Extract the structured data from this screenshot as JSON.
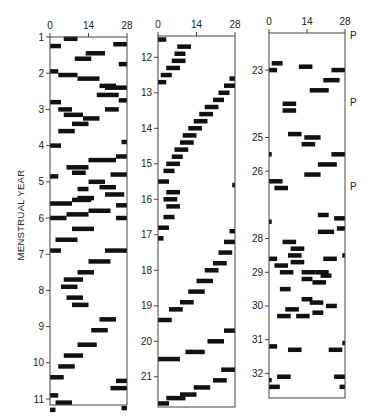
{
  "chart_data": {
    "type": "heatmap",
    "title": "",
    "ylabel": "MENSTRUAL YEAR",
    "xlabel": "",
    "x_range": [
      0,
      28
    ],
    "x_ticks": [
      0,
      14,
      28
    ],
    "annotation_label": "P",
    "panels": [
      {
        "name": "panel-1",
        "ylim": [
          1,
          11.2
        ],
        "y_ticks": [
          1,
          2,
          3,
          4,
          5,
          6,
          7,
          8,
          9,
          10,
          11
        ],
        "marks": [
          [
            5,
            10,
            1.05
          ],
          [
            0,
            4,
            1.25
          ],
          [
            23,
            28,
            1.2
          ],
          [
            13,
            20,
            1.45
          ],
          [
            9,
            15,
            1.6
          ],
          [
            25,
            28,
            1.75
          ],
          [
            0,
            3,
            1.95
          ],
          [
            3,
            10,
            2.05
          ],
          [
            10,
            18,
            2.15
          ],
          [
            18,
            24,
            2.35
          ],
          [
            20,
            28,
            2.4
          ],
          [
            17,
            25,
            2.6
          ],
          [
            25,
            28,
            2.75
          ],
          [
            0,
            4,
            2.8
          ],
          [
            3,
            8,
            3.0
          ],
          [
            20,
            25,
            3.0
          ],
          [
            5,
            12,
            3.15
          ],
          [
            12,
            18,
            3.25
          ],
          [
            8,
            14,
            3.4
          ],
          [
            3,
            9,
            3.6
          ],
          [
            0,
            4,
            4.0
          ],
          [
            26,
            28,
            3.9
          ],
          [
            14,
            24,
            4.4
          ],
          [
            24,
            28,
            4.3
          ],
          [
            6,
            14,
            4.6
          ],
          [
            8,
            13,
            4.75
          ],
          [
            0,
            3,
            4.85
          ],
          [
            22,
            28,
            4.8
          ],
          [
            14,
            20,
            5.0
          ],
          [
            18,
            24,
            5.15
          ],
          [
            10,
            14,
            5.2
          ],
          [
            20,
            27,
            5.35
          ],
          [
            10,
            16,
            5.45
          ],
          [
            0,
            8,
            5.6
          ],
          [
            8,
            15,
            5.5
          ],
          [
            24,
            28,
            5.65
          ],
          [
            0,
            6,
            6.0
          ],
          [
            6,
            14,
            5.9
          ],
          [
            14,
            22,
            5.8
          ],
          [
            24,
            28,
            6.0
          ],
          [
            8,
            16,
            6.3
          ],
          [
            2,
            10,
            6.6
          ],
          [
            0,
            4,
            6.9
          ],
          [
            20,
            28,
            6.9
          ],
          [
            14,
            22,
            7.2
          ],
          [
            10,
            16,
            7.5
          ],
          [
            5,
            12,
            7.7
          ],
          [
            4,
            10,
            7.9
          ],
          [
            6,
            12,
            8.2
          ],
          [
            8,
            14,
            8.4
          ],
          [
            18,
            24,
            8.8
          ],
          [
            15,
            21,
            9.1
          ],
          [
            10,
            17,
            9.5
          ],
          [
            5,
            12,
            9.8
          ],
          [
            3,
            9,
            10.1
          ],
          [
            0,
            5,
            10.4
          ],
          [
            24,
            28,
            10.5
          ],
          [
            22,
            28,
            10.7
          ],
          [
            0,
            3,
            10.9
          ],
          [
            2,
            8,
            11.1
          ],
          [
            26,
            28,
            11.25
          ],
          [
            0,
            2,
            11.3
          ]
        ]
      },
      {
        "name": "panel-2",
        "ylim": [
          11.4,
          21.8
        ],
        "y_ticks": [
          12,
          13,
          14,
          15,
          16,
          17,
          18,
          19,
          20,
          21
        ],
        "marks": [
          [
            0,
            3,
            11.5
          ],
          [
            7,
            12,
            11.7
          ],
          [
            6,
            10,
            11.9
          ],
          [
            5,
            10,
            12.1
          ],
          [
            3,
            8,
            12.3
          ],
          [
            1,
            5,
            12.5
          ],
          [
            0,
            3,
            12.7
          ],
          [
            26,
            28,
            12.6
          ],
          [
            24,
            28,
            12.8
          ],
          [
            22,
            26,
            13.0
          ],
          [
            20,
            24,
            13.2
          ],
          [
            17,
            22,
            13.4
          ],
          [
            15,
            20,
            13.6
          ],
          [
            13,
            18,
            13.8
          ],
          [
            11,
            16,
            14.0
          ],
          [
            9,
            14,
            14.2
          ],
          [
            8,
            13,
            14.4
          ],
          [
            6,
            11,
            14.6
          ],
          [
            5,
            9,
            14.8
          ],
          [
            3,
            8,
            15.0
          ],
          [
            2,
            6,
            15.2
          ],
          [
            0,
            4,
            15.5
          ],
          [
            27,
            28,
            15.6
          ],
          [
            3,
            8,
            15.8
          ],
          [
            2,
            7,
            16.0
          ],
          [
            3,
            8,
            16.2
          ],
          [
            2,
            6,
            16.5
          ],
          [
            0,
            4,
            16.8
          ],
          [
            0,
            2,
            17.1
          ],
          [
            26,
            28,
            16.9
          ],
          [
            24,
            28,
            17.2
          ],
          [
            22,
            27,
            17.5
          ],
          [
            20,
            25,
            17.8
          ],
          [
            17,
            22,
            18.0
          ],
          [
            14,
            20,
            18.3
          ],
          [
            11,
            17,
            18.6
          ],
          [
            8,
            13,
            18.9
          ],
          [
            4,
            9,
            19.1
          ],
          [
            0,
            5,
            19.4
          ],
          [
            24,
            28,
            19.7
          ],
          [
            18,
            24,
            20.0
          ],
          [
            10,
            17,
            20.3
          ],
          [
            0,
            8,
            20.5
          ],
          [
            23,
            28,
            20.8
          ],
          [
            20,
            25,
            21.1
          ],
          [
            13,
            19,
            21.3
          ],
          [
            8,
            14,
            21.5
          ],
          [
            3,
            10,
            21.6
          ],
          [
            0,
            4,
            21.75
          ]
        ]
      },
      {
        "name": "panel-3",
        "ylim": [
          21.9,
          32.7
        ],
        "y_ticks": [
          23,
          25,
          26,
          28,
          29,
          30,
          31,
          32
        ],
        "p_marks": [
          21.95,
          23.95,
          26.45
        ],
        "marks": [
          [
            1,
            5,
            22.8
          ],
          [
            0,
            3,
            23.0
          ],
          [
            11,
            16,
            22.9
          ],
          [
            23,
            28,
            23.0
          ],
          [
            20,
            26,
            23.3
          ],
          [
            15,
            22,
            23.6
          ],
          [
            5,
            10,
            24.0
          ],
          [
            5,
            10,
            24.2
          ],
          [
            7,
            12,
            24.9
          ],
          [
            13,
            19,
            25.0
          ],
          [
            12,
            17,
            25.2
          ],
          [
            23,
            28,
            25.5
          ],
          [
            18,
            25,
            25.8
          ],
          [
            13,
            19,
            26.1
          ],
          [
            0,
            1,
            25.5
          ],
          [
            0,
            5,
            26.3
          ],
          [
            2,
            7,
            26.5
          ],
          [
            18,
            22,
            27.3
          ],
          [
            24,
            28,
            27.4
          ],
          [
            0,
            1,
            27.5
          ],
          [
            18,
            24,
            27.8
          ],
          [
            25,
            28,
            27.7
          ],
          [
            5,
            10,
            28.1
          ],
          [
            8,
            13,
            28.3
          ],
          [
            7,
            12,
            28.5
          ],
          [
            8,
            13,
            28.7
          ],
          [
            0,
            3,
            28.6
          ],
          [
            2,
            7,
            28.8
          ],
          [
            20,
            25,
            28.6
          ],
          [
            27,
            28,
            28.5
          ],
          [
            4,
            9,
            29.0
          ],
          [
            12,
            17,
            29.0
          ],
          [
            17,
            22,
            29.0
          ],
          [
            19,
            23,
            29.1
          ],
          [
            12,
            16,
            29.2
          ],
          [
            16,
            21,
            29.3
          ],
          [
            4,
            8,
            29.5
          ],
          [
            12,
            16,
            29.8
          ],
          [
            15,
            20,
            29.9
          ],
          [
            21,
            25,
            30.0
          ],
          [
            6,
            11,
            30.1
          ],
          [
            16,
            20,
            30.2
          ],
          [
            3,
            8,
            30.3
          ],
          [
            10,
            15,
            30.3
          ],
          [
            0,
            3,
            31.2
          ],
          [
            7,
            12,
            31.3
          ],
          [
            22,
            27,
            31.3
          ],
          [
            27,
            28,
            31.1
          ],
          [
            3,
            8,
            32.1
          ],
          [
            24,
            28,
            32.1
          ],
          [
            0,
            1,
            32.2
          ],
          [
            0,
            4,
            32.4
          ],
          [
            26,
            28,
            32.4
          ]
        ]
      }
    ]
  }
}
